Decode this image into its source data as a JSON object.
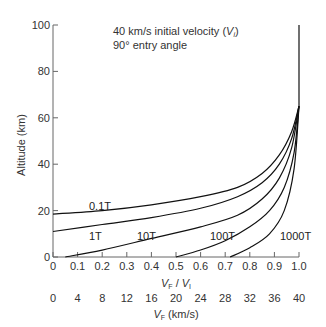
{
  "chart_data": {
    "type": "line",
    "title": "40 km/s initial velocity (Vi)",
    "subtitle": "90° entry angle",
    "ylabel": "Altitude (km)",
    "xlabel": "VF / VI",
    "xlabel2": "VF (km/s)",
    "ylim": [
      0,
      100
    ],
    "xlim": [
      0,
      1.0
    ],
    "yticks": [
      "0",
      "20",
      "40",
      "60",
      "80",
      "100"
    ],
    "xticks": [
      "0",
      "0.1",
      "0.2",
      "0.3",
      "0.4",
      "0.5",
      "0.6",
      "0.7",
      "0.8",
      "0.9",
      "1.0"
    ],
    "xticks2": [
      "0",
      "4",
      "8",
      "12",
      "16",
      "20",
      "24",
      "28",
      "32",
      "36",
      "40"
    ],
    "grid": false,
    "series": [
      {
        "name": "0.1T",
        "x": [
          0,
          0.2,
          0.4,
          0.6,
          0.75,
          0.85,
          0.92,
          0.97,
          1.0
        ],
        "y": [
          18.5,
          20,
          22.5,
          26,
          30,
          36,
          44,
          54,
          65
        ]
      },
      {
        "name": "1T",
        "x": [
          0,
          0.2,
          0.4,
          0.6,
          0.75,
          0.85,
          0.92,
          0.97,
          1.0
        ],
        "y": [
          11,
          14,
          17,
          21,
          26,
          32,
          40,
          51,
          65
        ]
      },
      {
        "name": "10T",
        "x": [
          0.05,
          0.2,
          0.4,
          0.6,
          0.75,
          0.85,
          0.92,
          0.97,
          1.0
        ],
        "y": [
          0,
          3,
          8,
          13,
          18,
          25,
          34,
          47,
          65
        ]
      },
      {
        "name": "100T",
        "x": [
          0.5,
          0.6,
          0.7,
          0.8,
          0.88,
          0.94,
          0.98,
          1.0
        ],
        "y": [
          0,
          3,
          7,
          13,
          20,
          30,
          45,
          65
        ]
      },
      {
        "name": "1000T",
        "x": [
          0.72,
          0.8,
          0.88,
          0.94,
          0.98,
          1.0
        ],
        "y": [
          0,
          4,
          10,
          20,
          38,
          65
        ]
      }
    ],
    "vertical_line": {
      "x": 1.0,
      "y": [
        65,
        100
      ]
    }
  },
  "labels": {
    "title_line1": "40 km/s initial velocity (",
    "title_vi": "V",
    "title_vi_sub": "i",
    "title_close": ")",
    "title_line2": "90° entry angle",
    "ylabel": "Altitude (km)",
    "xlabel_vf": "V",
    "xlabel_vf_sub": "F",
    "xlabel_slash": " / ",
    "xlabel_vi": "V",
    "xlabel_vi_sub": "I",
    "xlabel2_vf": "V",
    "xlabel2_vf_sub": "F",
    "xlabel2_units": " (km/s)",
    "series_labels": [
      "0.1T",
      "1T",
      "10T",
      "100T",
      "1000T"
    ]
  }
}
